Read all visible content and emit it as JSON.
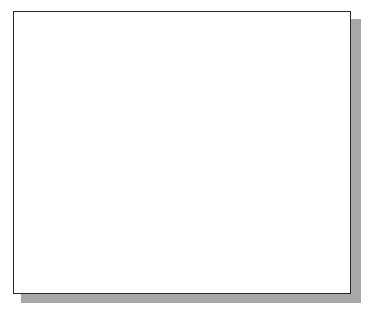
{
  "viewport": {
    "name": "drawing-viewport",
    "frame": {
      "x": 13,
      "y": 11,
      "width": 338,
      "height": 283
    },
    "shadow_color": "#a8a8a8",
    "border_color": "#2a2a2a"
  },
  "grid": {
    "color": "#c8c8c8",
    "spacing": 32,
    "vertical_x": [
      19,
      50,
      82,
      114,
      146,
      178,
      210,
      242,
      274,
      306,
      337
    ],
    "horizontal_y": [
      33,
      65,
      98,
      130,
      162,
      194,
      227,
      259,
      290
    ]
  },
  "axes": {
    "color": "#222222",
    "x_axis_y": 227,
    "y_axis_x": 210,
    "y_axis_color": "#555555"
  },
  "sketch": {
    "line_color": "#1a1a1a",
    "line_width": 2.2,
    "lines": [
      {
        "name": "main-line",
        "x1": 36,
        "y1": 133,
        "x2": 316,
        "y2": 27
      },
      {
        "name": "left-leg",
        "x1": 36,
        "y1": 133,
        "x2": 96,
        "y2": 281
      },
      {
        "name": "branch-1",
        "x1": 86,
        "y1": 115,
        "x2": 163,
        "y2": 187
      },
      {
        "name": "branch-2",
        "x1": 192,
        "y1": 75,
        "x2": 227,
        "y2": 261
      },
      {
        "name": "branch-3",
        "x1": 236,
        "y1": 57,
        "x2": 308,
        "y2": 204
      }
    ]
  },
  "cursor": {
    "icon": "crosshair-cursor-icon",
    "x": 296,
    "y": 145,
    "rubber_band": {
      "x": 297,
      "y1": 35,
      "y2": 145,
      "color": "#555555"
    },
    "text_cursor": {
      "icon": "ibeam-icon",
      "x": 308,
      "y1": 150,
      "y2": 162
    }
  }
}
